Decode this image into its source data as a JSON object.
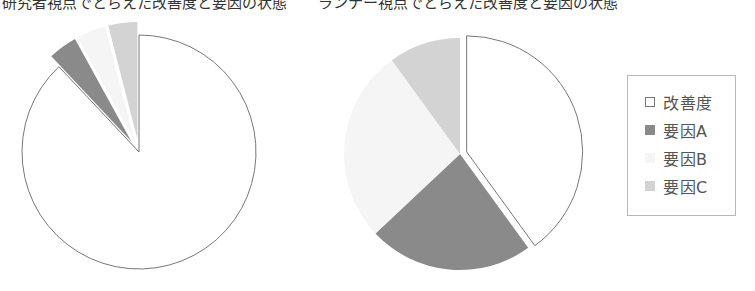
{
  "caption": {
    "left": "研究者視点でとらえた改善度と要因の状態",
    "right": "ランナー視点でとらえた改善度と要因の状態"
  },
  "legend": {
    "items": [
      {
        "label": "改善度",
        "color": "#ffffff",
        "border": "#777777"
      },
      {
        "label": "要因A",
        "color": "#8a8a8a",
        "border": "#8a8a8a"
      },
      {
        "label": "要因B",
        "color": "#f5f5f5",
        "border": "#f5f5f5"
      },
      {
        "label": "要因C",
        "color": "#d3d3d3",
        "border": "#d3d3d3"
      }
    ]
  },
  "chart_data": [
    {
      "type": "pie",
      "title": "研究者視点",
      "categories": [
        "改善度",
        "要因A",
        "要因B",
        "要因C"
      ],
      "values": [
        88,
        4,
        4,
        4
      ],
      "colors": [
        "#ffffff",
        "#8a8a8a",
        "#f5f5f5",
        "#d3d3d3"
      ],
      "start_angle": "12 o'clock, clockwise",
      "exploded": [
        "要因A",
        "要因B",
        "要因C"
      ],
      "legend_position": "right"
    },
    {
      "type": "pie",
      "title": "ランナー視点",
      "categories": [
        "改善度",
        "要因A",
        "要因B",
        "要因C"
      ],
      "values": [
        40,
        23,
        27,
        10
      ],
      "colors": [
        "#ffffff",
        "#8a8a8a",
        "#f5f5f5",
        "#d3d3d3"
      ],
      "start_angle": "12 o'clock, clockwise",
      "exploded": [
        "改善度"
      ],
      "legend_position": "right"
    }
  ]
}
